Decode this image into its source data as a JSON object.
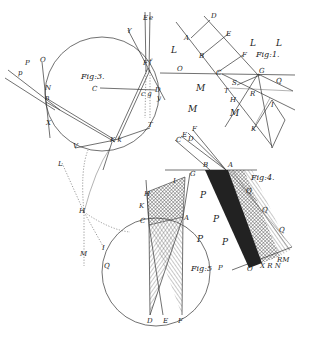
{
  "plate": {
    "figures": [
      {
        "id": "fig1",
        "title": "Fig:1.",
        "labels": [
          "A",
          "B",
          "C",
          "D",
          "E",
          "F",
          "G",
          "H",
          "I",
          "K",
          "L",
          "L",
          "L",
          "M",
          "M",
          "O",
          "Q",
          "R",
          "S",
          "T"
        ]
      },
      {
        "id": "fig3",
        "title": "Fig:3.",
        "labels": [
          "E",
          "e",
          "F",
          "f",
          "Y",
          "y",
          "C",
          "D",
          "d",
          "c",
          "g",
          "O",
          "P",
          "p",
          "N",
          "n",
          "X",
          "K",
          "k",
          "T",
          "V"
        ]
      },
      {
        "id": "fig4",
        "title": "Fig:4.",
        "labels": [
          "A",
          "B",
          "C",
          "D",
          "E",
          "F",
          "G",
          "M",
          "N",
          "O",
          "P",
          "P",
          "P",
          "P",
          "Q",
          "Q",
          "Q",
          "R",
          "X"
        ]
      },
      {
        "id": "fig5",
        "title": "Fig:5",
        "labels": [
          "A",
          "C",
          "D",
          "E",
          "F",
          "G",
          "H",
          "I",
          "K",
          "Q",
          "P"
        ]
      },
      {
        "id": "fig2",
        "title": "",
        "labels": [
          "H",
          "I",
          "L",
          "M"
        ]
      }
    ],
    "text": {
      "fig1_title": "Fig:1.",
      "fig3_title": "Fig:3.",
      "fig4_title": "Fig:4.",
      "fig5_title": "Fig:5"
    }
  }
}
